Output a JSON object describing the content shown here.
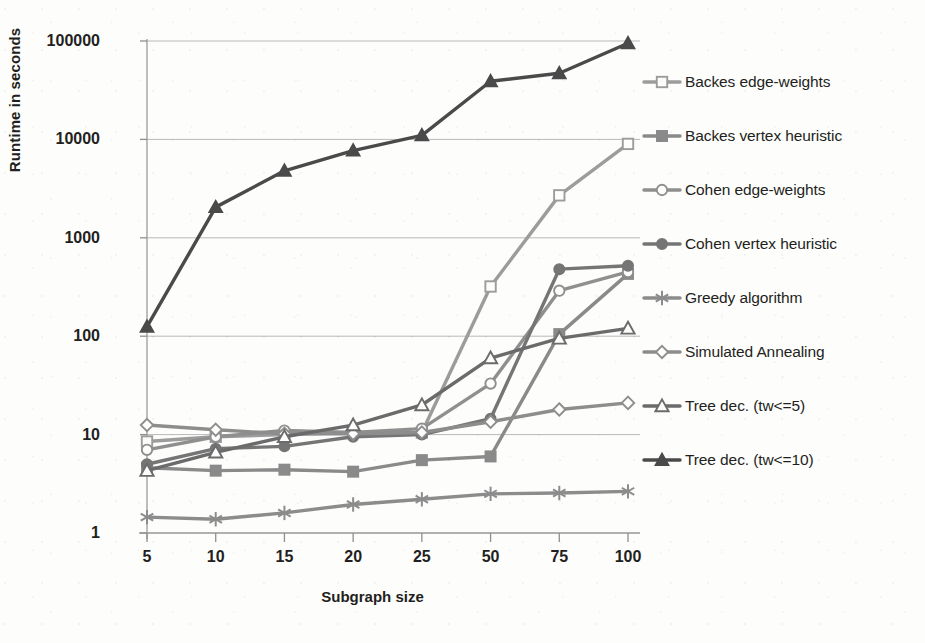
{
  "chart_data": {
    "type": "line",
    "title": "",
    "xlabel": "Subgraph size",
    "ylabel": "Runtime in seconds",
    "yscale": "log",
    "ylim": [
      1,
      100000
    ],
    "yticks": [
      "1",
      "10",
      "100",
      "1000",
      "10000",
      "100000"
    ],
    "grid": "horizontal",
    "legend_position": "right",
    "categories": [
      "5",
      "10",
      "15",
      "20",
      "25",
      "50",
      "75",
      "100"
    ],
    "series": [
      {
        "name": "Backes edge-weights",
        "marker": "open-square",
        "color": "#9c9c9c",
        "values": [
          8.5,
          9.5,
          10,
          10.5,
          10.5,
          320,
          2700,
          9000
        ]
      },
      {
        "name": "Backes vertex heuristic",
        "marker": "filled-square",
        "color": "#8a8a8a",
        "values": [
          4.6,
          4.3,
          4.4,
          4.2,
          5.5,
          6.0,
          105,
          430
        ]
      },
      {
        "name": "Cohen edge-weights",
        "marker": "open-circle",
        "color": "#8f8f8f",
        "values": [
          7.0,
          9.5,
          11.0,
          10.5,
          11.5,
          33,
          290,
          450
        ]
      },
      {
        "name": "Cohen vertex heuristic",
        "marker": "filled-circle",
        "color": "#757575",
        "values": [
          5.0,
          7.2,
          7.6,
          9.5,
          10.0,
          14.5,
          480,
          520
        ]
      },
      {
        "name": "Greedy algorithm",
        "marker": "asterisk",
        "color": "#8c8c8c",
        "values": [
          1.45,
          1.38,
          1.6,
          1.95,
          2.2,
          2.5,
          2.55,
          2.65
        ]
      },
      {
        "name": "Simulated Annealing",
        "marker": "open-diamond",
        "color": "#8d8d8d",
        "values": [
          12.5,
          11.2,
          10.2,
          10.2,
          10.5,
          13.5,
          18,
          21
        ]
      },
      {
        "name": "Tree dec. (tw<=5)",
        "marker": "open-triangle",
        "color": "#6b6b6b",
        "values": [
          4.3,
          6.6,
          9.5,
          12.5,
          20,
          60,
          95,
          120
        ]
      },
      {
        "name": "Tree dec. (tw<=10)",
        "marker": "filled-triangle",
        "color": "#4a4a4a",
        "values": [
          125,
          2050,
          4800,
          7700,
          11000,
          39000,
          47000,
          95000
        ]
      }
    ]
  },
  "axes": {
    "y_title": "Runtime in seconds",
    "x_title": "Subgraph size",
    "y_ticks": [
      "100000",
      "10000",
      "1000",
      "100",
      "10",
      "1"
    ],
    "x_ticks": [
      "5",
      "10",
      "15",
      "20",
      "25",
      "50",
      "75",
      "100"
    ]
  },
  "legend": {
    "items": [
      {
        "label": "Backes edge-weights",
        "marker": "open-square",
        "color": "#9c9c9c"
      },
      {
        "label": "Backes vertex heuristic",
        "marker": "filled-square",
        "color": "#8a8a8a"
      },
      {
        "label": "Cohen edge-weights",
        "marker": "open-circle",
        "color": "#8f8f8f"
      },
      {
        "label": "Cohen vertex heuristic",
        "marker": "filled-circle",
        "color": "#757575"
      },
      {
        "label": "Greedy algorithm",
        "marker": "asterisk",
        "color": "#8c8c8c"
      },
      {
        "label": "Simulated Annealing",
        "marker": "open-diamond",
        "color": "#8d8d8d"
      },
      {
        "label": "Tree dec. (tw<=5)",
        "marker": "open-triangle",
        "color": "#6b6b6b"
      },
      {
        "label": "Tree dec. (tw<=10)",
        "marker": "filled-triangle",
        "color": "#4a4a4a"
      }
    ]
  }
}
